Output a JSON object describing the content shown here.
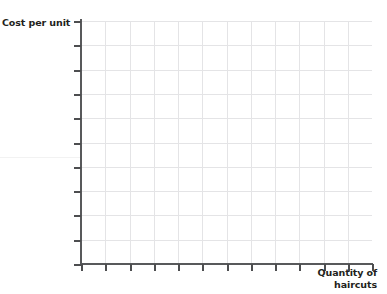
{
  "figure": {
    "background_color": "#ffffff",
    "axis_color": "#58595b",
    "grid_color": "#e2e2e4",
    "text_color": "#231f20"
  },
  "axes": {
    "y_title": "Cost per unit",
    "x_title_line1": "Quantity of",
    "x_title_line2": "haircuts"
  },
  "chart_data": {
    "type": "line",
    "title": "",
    "subtitle": "",
    "xlabel": "Quantity of haircuts",
    "ylabel": "Cost per unit",
    "x": [],
    "series": [],
    "categories": [],
    "values": [],
    "xlim": [
      0,
      12
    ],
    "ylim": [
      0,
      10
    ],
    "xticks": [
      0,
      1,
      2,
      3,
      4,
      5,
      6,
      7,
      8,
      9,
      10,
      11,
      12
    ],
    "yticks": [
      0,
      1,
      2,
      3,
      4,
      5,
      6,
      7,
      8,
      9,
      10
    ],
    "xticklabels": [],
    "yticklabels": [],
    "grid": true,
    "grid_columns": 12,
    "grid_rows": 10,
    "legend": null,
    "legend_position": "none",
    "annotations": [],
    "note": "Blank grid template; no data series plotted."
  }
}
